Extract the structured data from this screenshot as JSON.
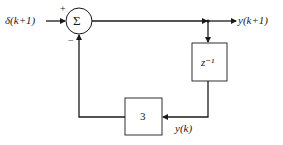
{
  "diagram": {
    "type": "block-diagram",
    "input": {
      "label": "δ(k+1)"
    },
    "summing_junction": {
      "symbol": "Σ",
      "signs": {
        "input": "+",
        "feedback": "−"
      }
    },
    "output": {
      "label": "y(k+1)"
    },
    "delay_block": {
      "label": "z⁻¹"
    },
    "gain_block": {
      "label": "3"
    },
    "feedback_signal": {
      "label": "y(k)"
    }
  },
  "colors": {
    "line": "#1a1a1a",
    "background": "#ffffff"
  }
}
